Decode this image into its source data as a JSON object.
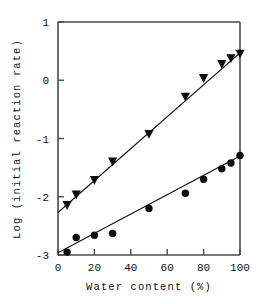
{
  "chart_data": {
    "type": "scatter",
    "title": "",
    "xlabel": "Water content (%)",
    "ylabel": "Log (initial reaction rate)",
    "xlim": [
      0,
      100
    ],
    "ylim": [
      -3,
      1
    ],
    "xticks": [
      0,
      20,
      40,
      60,
      80,
      100
    ],
    "yticks": [
      1,
      0,
      -1,
      -2,
      -3
    ],
    "xtick_labels": [
      "0",
      "20",
      "40",
      "60",
      "80",
      "100"
    ],
    "ytick_labels": [
      "1",
      "0",
      "-1",
      "-2",
      "-3"
    ],
    "grid": false,
    "legend": "none",
    "series": [
      {
        "name": "triangle-series",
        "marker": "triangle-down",
        "color": "#0d0d0d",
        "points": [
          {
            "x": 5,
            "y": -2.15
          },
          {
            "x": 10,
            "y": -1.97
          },
          {
            "x": 20,
            "y": -1.72
          },
          {
            "x": 30,
            "y": -1.4
          },
          {
            "x": 50,
            "y": -0.93
          },
          {
            "x": 70,
            "y": -0.29
          },
          {
            "x": 80,
            "y": 0.03
          },
          {
            "x": 90,
            "y": 0.27
          },
          {
            "x": 95,
            "y": 0.37
          },
          {
            "x": 100,
            "y": 0.45
          }
        ],
        "fit_line": {
          "x0": 0,
          "y0": -2.27,
          "x1": 100,
          "y1": 0.47
        }
      },
      {
        "name": "circle-series",
        "marker": "circle",
        "color": "#0d0d0d",
        "points": [
          {
            "x": 5,
            "y": -2.95
          },
          {
            "x": 10,
            "y": -2.7
          },
          {
            "x": 20,
            "y": -2.66
          },
          {
            "x": 30,
            "y": -2.63
          },
          {
            "x": 50,
            "y": -2.2
          },
          {
            "x": 70,
            "y": -1.94
          },
          {
            "x": 80,
            "y": -1.7
          },
          {
            "x": 90,
            "y": -1.52
          },
          {
            "x": 95,
            "y": -1.42
          },
          {
            "x": 100,
            "y": -1.29
          }
        ],
        "fit_line": {
          "x0": 0,
          "y0": -2.96,
          "x1": 100,
          "y1": -1.3
        }
      }
    ]
  },
  "axes": {
    "x_title": "Water content (%)",
    "y_title": "Log (initial reaction rate)"
  }
}
